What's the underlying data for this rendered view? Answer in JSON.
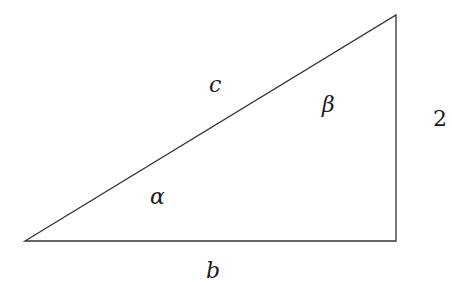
{
  "diagram": {
    "type": "right-triangle",
    "stroke_color": "#333333",
    "vertices": {
      "A": {
        "x": 25,
        "y": 241
      },
      "B": {
        "x": 396,
        "y": 15
      },
      "C": {
        "x": 396,
        "y": 241
      }
    },
    "labels": {
      "hypotenuse": "c",
      "base": "b",
      "height": "2",
      "angle_at_A": "α",
      "angle_at_B": "β"
    }
  }
}
